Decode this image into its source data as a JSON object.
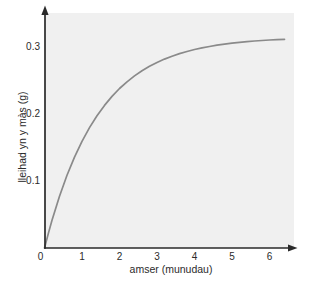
{
  "chart_data": {
    "type": "line",
    "title": "",
    "xlabel": "amser (munudau)",
    "ylabel": "lleihad yn y màs (g)",
    "xlim": [
      0,
      6.7
    ],
    "ylim": [
      0,
      0.34
    ],
    "x_ticks": [
      0,
      1,
      2,
      3,
      4,
      5,
      6
    ],
    "y_ticks": [
      0.1,
      0.2,
      0.3
    ],
    "grid": false,
    "legend": false,
    "line_color": "#8a8a8a",
    "plateau_value": 0.312,
    "series": [
      {
        "name": "curve",
        "x": [
          0,
          0.1,
          0.2,
          0.4,
          0.6,
          0.8,
          1.0,
          1.2,
          1.4,
          1.6,
          1.8,
          2.0,
          2.2,
          2.4,
          2.6,
          2.8,
          3.0,
          3.2,
          3.4,
          3.6,
          3.8,
          4.0,
          4.2,
          4.4,
          4.6,
          4.8,
          5.0,
          5.2,
          5.4,
          5.6,
          5.8,
          6.0,
          6.2,
          6.4
        ],
        "y": [
          0,
          0.0215,
          0.0414,
          0.0773,
          0.1085,
          0.1357,
          0.1592,
          0.1797,
          0.1975,
          0.2129,
          0.2263,
          0.238,
          0.2481,
          0.2569,
          0.2645,
          0.2712,
          0.2769,
          0.2819,
          0.2863,
          0.2901,
          0.2933,
          0.2962,
          0.2987,
          0.3008,
          0.3027,
          0.3043,
          0.3057,
          0.3069,
          0.308,
          0.3089,
          0.3097,
          0.3104,
          0.311,
          0.3115
        ]
      }
    ]
  }
}
